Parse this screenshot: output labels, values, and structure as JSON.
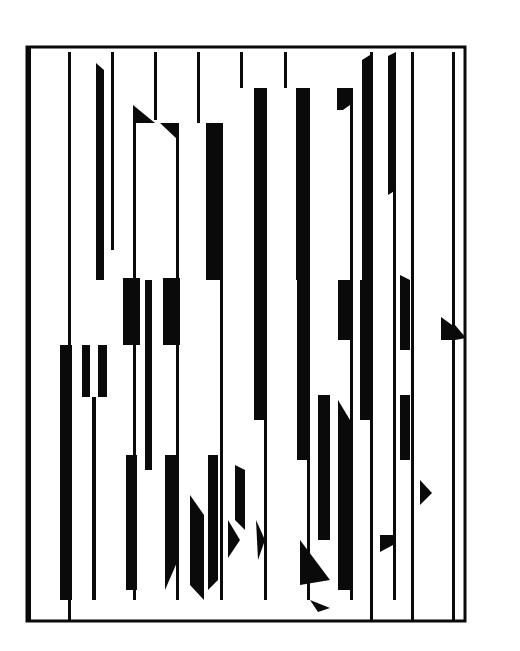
{
  "artwork": {
    "type": "abstract op-art print (scanned)",
    "background": "#ffffff",
    "ink": "#0a0a0a",
    "frame": {
      "x": 27,
      "y": 47,
      "w": 438,
      "h": 574,
      "stroke": 3
    },
    "signature": {
      "x": 254,
      "y": 606,
      "text": ""
    },
    "thin_lines": [
      {
        "x": 28,
        "y1": 48,
        "y2": 620,
        "w": 3
      },
      {
        "x": 68,
        "y1": 52,
        "y2": 620,
        "w": 3
      },
      {
        "x": 111,
        "y1": 52,
        "y2": 250,
        "w": 3
      },
      {
        "x": 154,
        "y1": 52,
        "y2": 120,
        "w": 3
      },
      {
        "x": 197,
        "y1": 52,
        "y2": 123,
        "w": 3
      },
      {
        "x": 240,
        "y1": 52,
        "y2": 88,
        "w": 3
      },
      {
        "x": 284,
        "y1": 52,
        "y2": 88,
        "w": 3
      },
      {
        "x": 370,
        "y1": 52,
        "y2": 620,
        "w": 3
      },
      {
        "x": 411,
        "y1": 52,
        "y2": 620,
        "w": 3
      },
      {
        "x": 452,
        "y1": 52,
        "y2": 620,
        "w": 3
      },
      {
        "x": 133,
        "y1": 123,
        "y2": 600,
        "w": 3
      },
      {
        "x": 176,
        "y1": 123,
        "y2": 600,
        "w": 3
      },
      {
        "x": 220,
        "y1": 123,
        "y2": 600,
        "w": 3
      },
      {
        "x": 264,
        "y1": 88,
        "y2": 600,
        "w": 3
      },
      {
        "x": 307,
        "y1": 88,
        "y2": 600,
        "w": 3
      },
      {
        "x": 350,
        "y1": 88,
        "y2": 600,
        "w": 3
      },
      {
        "x": 393,
        "y1": 88,
        "y2": 600,
        "w": 3
      }
    ],
    "polygons": [
      "96,63 104,70 104,280 96,280",
      "133,105 155,123 133,123",
      "160,123 178,123 178,140",
      "206,123 220,123 220,280 206,280",
      "254,88 266,88 266,280 254,280",
      "296,88 310,88 310,280 296,280",
      "337,88 350,88 350,105 343,110 337,110",
      "362,60 370,55 370,280 362,280",
      "388,56 396,52 396,190 388,195",
      "60,345 72,345 72,600 60,600",
      "82,345 90,345 90,397 82,397",
      "98,345 107,345 107,397 98,397",
      "92,397 96,397 96,600 92,600",
      "123,278 140,278 140,345 123,345",
      "163,278 180,278 180,345 163,345",
      "126,455 137,455 137,590 126,590",
      "165,455 178,455 178,560 165,590",
      "208,455 218,455 218,580 208,590",
      "145,280 152,280 152,470 145,470",
      "254,280 266,280 266,420 254,420",
      "297,280 310,280 310,460 297,460",
      "338,280 350,280 350,340 338,340",
      "360,280 372,280 372,420 360,420",
      "400,275 410,280 410,350 400,350",
      "400,395 410,395 410,460 400,460",
      "441,317 452,325 452,340 441,340",
      "455,325 466,338 455,340",
      "235,465 245,470 245,530 235,520",
      "318,395 330,395 330,540 318,540",
      "338,400 350,420 350,590 338,590",
      "420,480 432,493 420,505",
      "380,535 393,535 393,545 380,552",
      "300,540 330,580 300,585",
      "310,600 330,608 318,612",
      "190,495 204,515 204,600 190,585",
      "228,520 240,540 228,558",
      "256,520 265,540 258,560"
    ]
  }
}
